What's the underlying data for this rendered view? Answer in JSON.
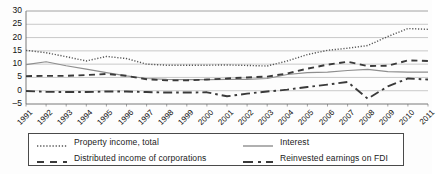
{
  "chart_data": {
    "type": "line",
    "title": "",
    "xlabel": "",
    "ylabel": "",
    "ylim": [
      -5,
      30
    ],
    "yticks": [
      -5,
      0,
      5,
      10,
      15,
      20,
      25,
      30
    ],
    "grid": true,
    "legend_position": "bottom",
    "categories": [
      "1991",
      "1992",
      "1993",
      "1994",
      "1995",
      "1996",
      "1997",
      "1998",
      "1999",
      "2000",
      "2001",
      "2002",
      "2003",
      "2004",
      "2005",
      "2006",
      "2007",
      "2008",
      "2009",
      "2010",
      "2011"
    ],
    "series": [
      {
        "name": "Property income, total",
        "style": "dotted",
        "color": "#555555",
        "values": [
          15.2,
          14.3,
          12.8,
          11.2,
          12.9,
          12.1,
          10.0,
          9.6,
          9.6,
          9.6,
          9.7,
          9.5,
          9.3,
          11.2,
          13.6,
          15.2,
          16.0,
          17.0,
          20.4,
          23.4,
          23.1
        ]
      },
      {
        "name": "Distributed income of corporations",
        "style": "dashed",
        "color": "#3a3a3a",
        "values": [
          5.5,
          5.6,
          5.6,
          5.9,
          6.3,
          5.6,
          4.3,
          3.9,
          3.9,
          4.2,
          4.6,
          5.0,
          5.3,
          6.5,
          8.3,
          9.8,
          10.9,
          9.3,
          9.4,
          11.4,
          11.2
        ]
      },
      {
        "name": "Interest",
        "style": "solid",
        "color": "#8e8e8e",
        "values": [
          9.8,
          10.9,
          9.4,
          8.1,
          6.8,
          5.6,
          4.6,
          4.3,
          4.2,
          4.2,
          4.3,
          4.3,
          4.6,
          6.1,
          6.8,
          7.0,
          7.6,
          8.0,
          7.2,
          7.0,
          7.0
        ]
      },
      {
        "name": "Reinvested earnings on FDI",
        "style": "longdash",
        "color": "#3a3a3a",
        "values": [
          -0.1,
          -0.4,
          -0.5,
          -0.5,
          -0.3,
          -0.3,
          -0.5,
          -0.7,
          -0.7,
          -0.6,
          -2.1,
          -1.1,
          -0.3,
          0.4,
          1.4,
          2.3,
          3.3,
          -3.0,
          1.6,
          4.6,
          4.2
        ]
      }
    ]
  },
  "legend": {
    "items": [
      {
        "label": "Property income, total",
        "swatch": "dotted-line-swatch"
      },
      {
        "label": "Distributed income of corporations",
        "swatch": "dashed-line-swatch"
      },
      {
        "label": "Interest",
        "swatch": "solid-line-swatch"
      },
      {
        "label": "Reinvested earnings on FDI",
        "swatch": "longdash-line-swatch"
      }
    ]
  }
}
